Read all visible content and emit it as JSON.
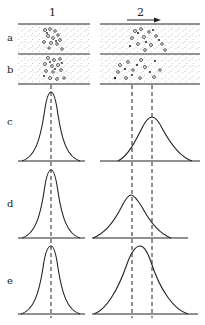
{
  "figure": {
    "column_labels": [
      "1",
      "2"
    ],
    "row_labels": [
      "a",
      "b",
      "c",
      "d",
      "e"
    ],
    "arrow_direction": "right",
    "colors": {
      "line": "#222222",
      "stipple": "#777777",
      "particle": "#333333",
      "background": "#ffffff"
    }
  },
  "panels": {
    "column_1": {
      "header": "1",
      "center_x": 51,
      "peaks": [
        {
          "row": "c",
          "peak_x": 51,
          "relative_height": "tall",
          "width": "narrow"
        },
        {
          "row": "d",
          "peak_x": 51,
          "relative_height": "tall",
          "width": "narrow"
        },
        {
          "row": "e",
          "peak_x": 51,
          "relative_height": "tall",
          "width": "narrow"
        }
      ]
    },
    "column_2": {
      "header": "2",
      "reference_lines_x": [
        132,
        152
      ],
      "peaks": [
        {
          "row": "c",
          "peak_x": 152,
          "relative_height": "low",
          "width": "broad"
        },
        {
          "row": "d",
          "peak_x": 131,
          "relative_height": "low",
          "width": "broad"
        },
        {
          "row": "e",
          "peak_x": 140,
          "relative_height": "tall",
          "width": "very broad"
        }
      ]
    }
  }
}
